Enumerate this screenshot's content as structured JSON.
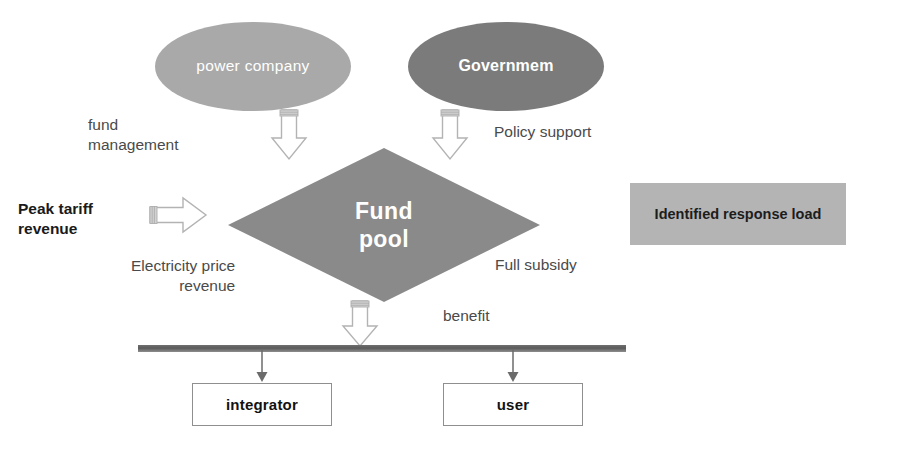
{
  "diagram": {
    "nodes": {
      "power_company": "power\ncompany",
      "government": "Governmem",
      "fund_pool_line1": "Fund",
      "fund_pool_line2": "pool",
      "identified_response_load": "Identified response\nload",
      "integrator": "integrator",
      "user": "user"
    },
    "labels": {
      "fund_management": "fund\nmanagement",
      "policy_support": "Policy support",
      "peak_tariff_revenue": "Peak tariff\nrevenue",
      "electricity_price_revenue": "Electricity price\nrevenue",
      "full_subsidy": "Full subsidy",
      "benefit": "benefit"
    },
    "colors": {
      "power_company_fill": "#a9a9a9",
      "government_fill": "#7b7b7b",
      "fund_pool_fill": "#8a8a8a",
      "identified_load_fill": "#b4b4b4",
      "bar_fill": "#5b5b5b",
      "arrow_outline": "#b0b0b0",
      "arrow_fill": "#ffffff",
      "box_border": "#8f8f8f",
      "label_text": "#4a4a4a",
      "bold_text": "#1a1a1a",
      "node_text": "#ffffff"
    },
    "arrows": [
      {
        "name": "fund-management-arrow",
        "direction": "down",
        "from": "power_company",
        "to": "fund_pool"
      },
      {
        "name": "policy-support-arrow",
        "direction": "down",
        "from": "government",
        "to": "fund_pool"
      },
      {
        "name": "peak-tariff-arrow",
        "direction": "right",
        "from": "peak_tariff_revenue",
        "to": "fund_pool"
      },
      {
        "name": "benefit-arrow",
        "direction": "down",
        "from": "fund_pool",
        "to": "distribution_bar"
      },
      {
        "name": "integrator-connector",
        "direction": "down",
        "from": "distribution_bar",
        "to": "integrator"
      },
      {
        "name": "user-connector",
        "direction": "down",
        "from": "distribution_bar",
        "to": "user"
      }
    ]
  }
}
